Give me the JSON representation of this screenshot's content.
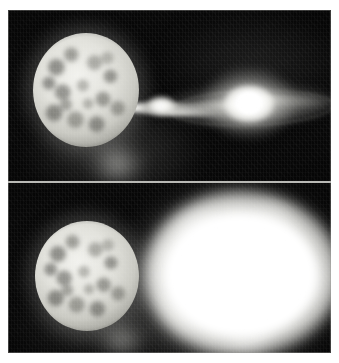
{
  "figure": {
    "kind": "astronomical-image",
    "caption_present": false,
    "background_color": "#ffffff",
    "frame_color": "#070707",
    "panel_count": 2,
    "orientation": "vertical-stack",
    "divider_color": "#d8d8d4"
  },
  "panels": [
    {
      "id": "panel-top",
      "position": "top",
      "label": "",
      "background": "#070707",
      "objects": [
        {
          "name": "donor-star",
          "description": "large mottled bright sphere at left",
          "center": [
            78,
            80
          ],
          "radius_px": 53,
          "peak_color": "#f2f2ee"
        },
        {
          "name": "accretion-stream",
          "description": "narrow bright gas stream flowing right from the donor star",
          "from": [
            112,
            99
          ],
          "to": [
            222,
            103
          ],
          "peak_color": "#ffffff"
        },
        {
          "name": "stream-knot",
          "description": "bright compact knot in the stream",
          "center": [
            153,
            96
          ],
          "peak_color": "#ffffff"
        },
        {
          "name": "accretion-disk",
          "description": "flattened edge-on disk surrounding the compact object",
          "center": [
            241,
            95
          ],
          "width_px": 178,
          "height_px": 46,
          "peak_color": "#d7d7d2"
        },
        {
          "name": "disk-core",
          "description": "saturated white central source of the disk",
          "center": [
            241,
            94
          ],
          "peak_color": "#ffffff"
        },
        {
          "name": "background-nebulosity",
          "description": "faint diffuse glow below the donor star",
          "center": [
            109,
            154
          ],
          "peak_color": "#d7d7d2"
        }
      ]
    },
    {
      "id": "panel-bottom",
      "position": "bottom",
      "label": "",
      "background": "#070707",
      "objects": [
        {
          "name": "donor-star",
          "description": "large mottled bright sphere at left, same star as top panel",
          "center": [
            79,
            93
          ],
          "radius_px": 52,
          "peak_color": "#f2f2ee"
        },
        {
          "name": "nova-shell",
          "description": "large diffuse saturated white expanding shell replacing the disk",
          "center": [
            234,
            91
          ],
          "width_px": 196,
          "height_px": 166,
          "peak_color": "#ffffff"
        },
        {
          "name": "background-nebulosity",
          "description": "faint diffuse glow below and right of the donor star",
          "center": [
            114,
            157
          ],
          "peak_color": "#d2d2cd"
        }
      ]
    }
  ]
}
